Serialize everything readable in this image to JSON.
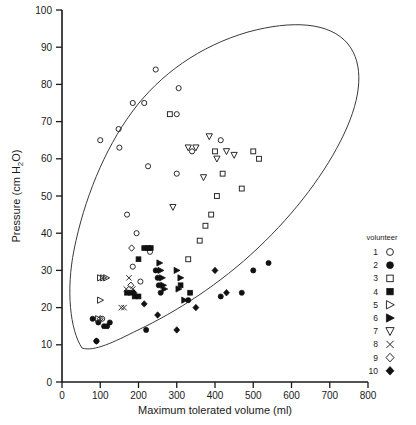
{
  "chart_data": {
    "type": "scatter",
    "title": "",
    "xlabel": "Maximum tolerated volume (ml)",
    "ylabel": "Pressure (cm H₂O)",
    "xlim": [
      0,
      800
    ],
    "ylim": [
      0,
      100
    ],
    "xticks": [
      0,
      100,
      200,
      300,
      400,
      500,
      600,
      700,
      800
    ],
    "yticks": [
      0,
      10,
      20,
      30,
      40,
      50,
      60,
      70,
      80,
      90,
      100
    ],
    "grid": false,
    "legend_position": "right",
    "legend_title": "volunteer",
    "annotations": [
      "Enclosing envelope curve drawn around all data points"
    ],
    "series": [
      {
        "name": "1",
        "marker": "open-circle",
        "points": [
          [
            100,
            65
          ],
          [
            245,
            84
          ],
          [
            185,
            75
          ],
          [
            215,
            75
          ],
          [
            300,
            72
          ],
          [
            305,
            79
          ],
          [
            148,
            68
          ],
          [
            150,
            63
          ],
          [
            225,
            58
          ],
          [
            340,
            62
          ],
          [
            170,
            45
          ],
          [
            195,
            40
          ],
          [
            230,
            35
          ],
          [
            185,
            31
          ],
          [
            205,
            27
          ],
          [
            105,
            17
          ],
          [
            415,
            65
          ],
          [
            300,
            56
          ]
        ]
      },
      {
        "name": "2",
        "marker": "filled-circle",
        "points": [
          [
            95,
            16
          ],
          [
            110,
            15
          ],
          [
            118,
            15
          ],
          [
            125,
            16
          ],
          [
            80,
            17
          ],
          [
            90,
            11
          ],
          [
            245,
            30
          ],
          [
            250,
            28
          ],
          [
            253,
            26
          ],
          [
            258,
            24
          ],
          [
            330,
            22
          ],
          [
            415,
            23
          ],
          [
            220,
            14
          ],
          [
            470,
            24
          ],
          [
            500,
            30
          ],
          [
            540,
            32
          ]
        ]
      },
      {
        "name": "3",
        "marker": "open-square",
        "points": [
          [
            282,
            72
          ],
          [
            400,
            62
          ],
          [
            420,
            56
          ],
          [
            405,
            50
          ],
          [
            390,
            45
          ],
          [
            375,
            42
          ],
          [
            360,
            38
          ],
          [
            330,
            33
          ],
          [
            500,
            62
          ],
          [
            515,
            60
          ],
          [
            470,
            52
          ]
        ]
      },
      {
        "name": "4",
        "marker": "filled-square",
        "points": [
          [
            215,
            36
          ],
          [
            225,
            36
          ],
          [
            232,
            36
          ],
          [
            200,
            33
          ],
          [
            170,
            24
          ],
          [
            180,
            24
          ],
          [
            190,
            23
          ],
          [
            200,
            23
          ],
          [
            310,
            26
          ],
          [
            335,
            24
          ]
        ]
      },
      {
        "name": "5",
        "marker": "open-right-triangle",
        "points": [
          [
            100,
            28
          ],
          [
            108,
            28
          ],
          [
            116,
            28
          ],
          [
            100,
            22
          ],
          [
            95,
            17
          ]
        ]
      },
      {
        "name": "6",
        "marker": "filled-right-triangle",
        "points": [
          [
            255,
            32
          ],
          [
            258,
            30
          ],
          [
            262,
            28
          ],
          [
            265,
            26
          ],
          [
            268,
            25
          ],
          [
            300,
            30
          ],
          [
            310,
            28
          ],
          [
            305,
            25
          ],
          [
            320,
            22
          ]
        ]
      },
      {
        "name": "7",
        "marker": "open-down-triangle",
        "points": [
          [
            330,
            63
          ],
          [
            350,
            63
          ],
          [
            385,
            66
          ],
          [
            405,
            60
          ],
          [
            370,
            55
          ],
          [
            290,
            47
          ],
          [
            430,
            62
          ],
          [
            450,
            61
          ]
        ]
      },
      {
        "name": "8",
        "marker": "x-cross",
        "points": [
          [
            175,
            28
          ],
          [
            168,
            25
          ],
          [
            185,
            25
          ],
          [
            155,
            20
          ],
          [
            162,
            20
          ]
        ]
      },
      {
        "name": "9",
        "marker": "open-diamond",
        "points": [
          [
            182,
            36
          ],
          [
            180,
            26
          ],
          [
            100,
            17
          ]
        ]
      },
      {
        "name": "10",
        "marker": "filled-diamond",
        "points": [
          [
            188,
            24
          ],
          [
            215,
            21
          ],
          [
            250,
            18
          ],
          [
            300,
            14
          ],
          [
            350,
            20
          ],
          [
            400,
            30
          ],
          [
            430,
            24
          ],
          [
            90,
            11
          ]
        ]
      }
    ]
  },
  "axes": {
    "x_title": "Maximum tolerated volume (ml)",
    "y_title_prefix": "Pressure (cm H",
    "y_title_sub": "2",
    "y_title_suffix": "O)",
    "x_tick_labels": [
      "0",
      "100",
      "200",
      "300",
      "400",
      "500",
      "600",
      "700",
      "800"
    ],
    "y_tick_labels": [
      "0",
      "10",
      "20",
      "30",
      "40",
      "50",
      "60",
      "70",
      "80",
      "90",
      "100"
    ]
  },
  "legend": {
    "title": "volunteer",
    "items": [
      {
        "label": "1",
        "marker": "open-circle"
      },
      {
        "label": "2",
        "marker": "filled-circle"
      },
      {
        "label": "3",
        "marker": "open-square"
      },
      {
        "label": "4",
        "marker": "filled-square"
      },
      {
        "label": "5",
        "marker": "open-right-triangle"
      },
      {
        "label": "6",
        "marker": "filled-right-triangle"
      },
      {
        "label": "7",
        "marker": "open-down-triangle"
      },
      {
        "label": "8",
        "marker": "x-cross"
      },
      {
        "label": "9",
        "marker": "open-diamond"
      },
      {
        "label": "10",
        "marker": "filled-diamond"
      }
    ]
  },
  "colors": {
    "ink": "#1a1a1a",
    "marker_stroke": "#2a2a2a",
    "marker_fill": "#111111",
    "envelope": "#3a3a3a",
    "background": "#ffffff"
  }
}
